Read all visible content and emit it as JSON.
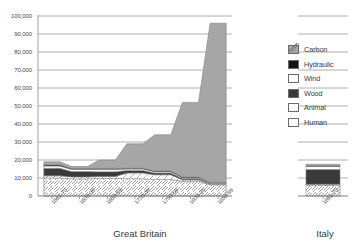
{
  "chart_data": {
    "type": "area",
    "title": "",
    "xlabel": "",
    "ylabel": "",
    "ylim": [
      0,
      100000
    ],
    "grid": true,
    "legend_position": "right",
    "y_ticks": [
      "0",
      "10,000",
      "20,000",
      "30,000",
      "40,000",
      "50,000",
      "60,000",
      "70,000",
      "80,000",
      "90,000",
      "100,000"
    ],
    "panels": [
      {
        "name": "Great Britain",
        "categories": [
          "1561-70",
          "1600-09",
          "1650-59",
          "1700-09",
          "1750-59",
          "1800-09",
          "1850-59"
        ],
        "series": [
          {
            "name": "Human",
            "values": [
              10000,
              9500,
              9800,
              9600,
              9200,
              8200,
              6200
            ]
          },
          {
            "name": "Animal",
            "values": [
              1200,
              1100,
              1100,
              3200,
              2600,
              800,
              400
            ]
          },
          {
            "name": "Wood",
            "values": [
              4200,
              3000,
              2600,
              1400,
              1000,
              700,
              400
            ]
          },
          {
            "name": "Wind",
            "values": [
              1300,
              1200,
              1300,
              800,
              700,
              500,
              300
            ]
          },
          {
            "name": "Hydraulic",
            "values": [
              600,
              500,
              500,
              400,
              400,
              300,
              200
            ]
          },
          {
            "name": "Carbon",
            "values": [
              1700,
              1100,
              4700,
              13600,
              20100,
              41500,
              88500
            ]
          }
        ],
        "totals": [
          19000,
          16400,
          20000,
          29000,
          34000,
          52000,
          96000
        ]
      },
      {
        "name": "Italy",
        "categories": [
          "1861-70"
        ],
        "series": [
          {
            "name": "Human",
            "values": [
              5800
            ]
          },
          {
            "name": "Animal",
            "values": [
              700
            ]
          },
          {
            "name": "Wood",
            "values": [
              8200
            ]
          },
          {
            "name": "Wind",
            "values": [
              1700
            ]
          },
          {
            "name": "Hydraulic",
            "values": [
              300
            ]
          },
          {
            "name": "Carbon",
            "values": [
              900
            ]
          }
        ],
        "totals": [
          17600
        ]
      }
    ],
    "legend": [
      {
        "label": "Carbon",
        "swatch": "carbon"
      },
      {
        "label": "Hydraulic",
        "swatch": "hydraulic"
      },
      {
        "label": "Wind",
        "swatch": "wind"
      },
      {
        "label": "Wood",
        "swatch": "wood"
      },
      {
        "label": "Animal",
        "swatch": "animal"
      },
      {
        "label": "Human",
        "swatch": "human"
      }
    ],
    "colors": {
      "carbon": "#a6a6a6",
      "hydraulic": "#111111",
      "wind": "#ffffff",
      "wood": "#3a3a3a",
      "animal": "#ffffff",
      "human": "#ffffff",
      "gridline": "#9a9a9a",
      "text": "#3b3b3b"
    }
  }
}
